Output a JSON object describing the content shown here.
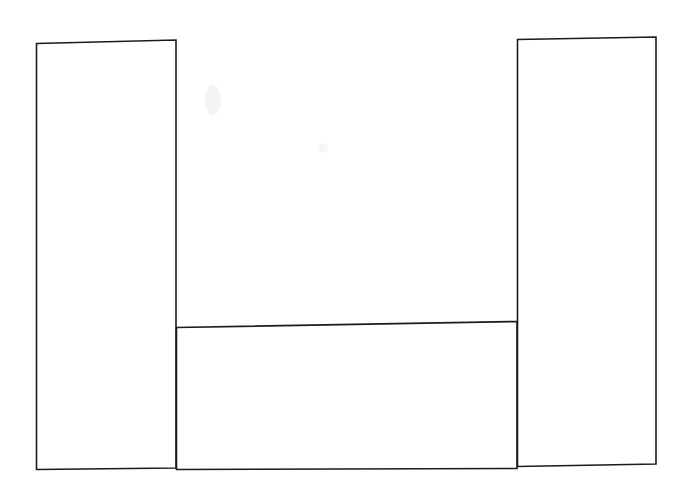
{
  "figure": {
    "title": "",
    "subtitle": "",
    "background_color": "#ffffff",
    "ink_color": "#1b1b1b",
    "medium": "hand-drawn pen on paper",
    "width_px": 691,
    "height_px": 493
  },
  "chart_data": {
    "type": "bar",
    "title": "",
    "xlabel": "",
    "ylabel": "",
    "categories": [
      "1",
      "2",
      "3"
    ],
    "values": [
      100,
      33,
      100
    ],
    "ylim": [
      0,
      100
    ],
    "grid": false,
    "legend": null,
    "axis_ticks": {
      "x": [],
      "y": []
    },
    "annotations": [],
    "bars": [
      {
        "name": "left-bar",
        "label": "",
        "value": 100,
        "value_label": "",
        "x_left_px": 36,
        "x_right_px": 176,
        "y_top_px": 41,
        "y_bottom_px": 469,
        "fill": "#ffffff",
        "stroke": "#1b1b1b"
      },
      {
        "name": "middle-bar",
        "label": "",
        "value": 33,
        "value_label": "",
        "x_left_px": 176,
        "x_right_px": 517,
        "y_top_px": 325,
        "y_bottom_px": 469,
        "fill": "#ffffff",
        "stroke": "#1b1b1b"
      },
      {
        "name": "right-bar",
        "label": "",
        "value": 100,
        "value_label": "",
        "x_left_px": 517,
        "x_right_px": 656,
        "y_top_px": 37,
        "y_bottom_px": 466,
        "fill": "#ffffff",
        "stroke": "#1b1b1b"
      }
    ],
    "baseline_y_px": 468
  },
  "paper": {
    "marks": [
      {
        "name": "faint-smudge-upper",
        "x": 205,
        "y": 86,
        "w": 16,
        "h": 28
      },
      {
        "name": "faint-smudge-middle",
        "x": 318,
        "y": 143,
        "w": 10,
        "h": 10
      },
      {
        "name": "faint-smudge-lower",
        "x": 206,
        "y": 420,
        "w": 14,
        "h": 18
      }
    ]
  }
}
